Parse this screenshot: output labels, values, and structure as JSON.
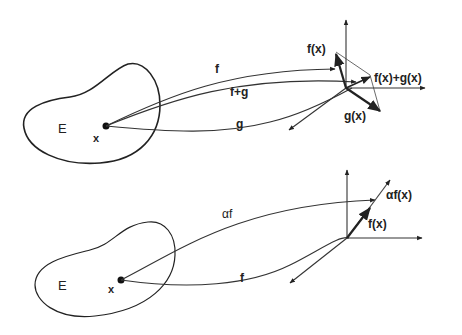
{
  "top_panel": {
    "set_label": "E",
    "point_label": "x",
    "curve_labels": {
      "f": "f",
      "f_plus_g": "f+g",
      "g": "g"
    },
    "vector_labels": {
      "fx": "f(x)",
      "gx": "g(x)",
      "sum": "f(x)+g(x)"
    }
  },
  "bottom_panel": {
    "set_label": "E",
    "point_label": "x",
    "curve_labels": {
      "alpha_f": "αf",
      "f": "f"
    },
    "vector_labels": {
      "fx": "f(x)",
      "alpha_fx": "αf(x)"
    }
  }
}
